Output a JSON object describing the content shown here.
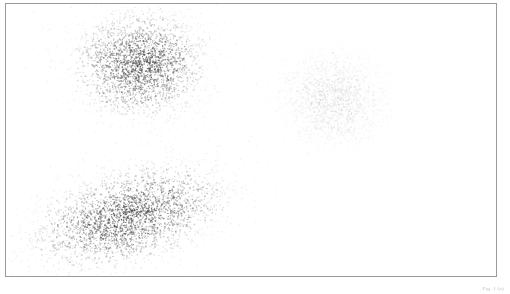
{
  "figure": {
    "title": "",
    "caption": "Fig. 1 (a)",
    "background_color": "#ffffff",
    "frame": {
      "border_color": "#9a9a9a",
      "border_width_px": 1,
      "x": 5,
      "y": 3,
      "width": 492,
      "height": 274
    }
  },
  "chart_data": {
    "type": "scatter",
    "title": "",
    "xlabel": "",
    "ylabel": "",
    "xlim": [
      0,
      510
    ],
    "ylim": [
      0,
      294
    ],
    "grid": false,
    "legend": null,
    "axis_ticks": false,
    "series": [
      {
        "name": "cluster-1-upper-left",
        "color": "#404040",
        "point_count": 2600,
        "marker_size_px": 1.1,
        "opacity": 0.85,
        "center_x": 140,
        "center_y": 64,
        "spread_x": 34,
        "spread_y": 28,
        "rotation_deg": 0,
        "shape": "round",
        "density_profile": "gaussian"
      },
      {
        "name": "cluster-2-upper-right-faint",
        "color": "#c9c9c9",
        "point_count": 2400,
        "marker_size_px": 1.1,
        "opacity": 0.5,
        "center_x": 333,
        "center_y": 98,
        "spread_x": 32,
        "spread_y": 29,
        "rotation_deg": 0,
        "shape": "round",
        "density_profile": "gaussian"
      },
      {
        "name": "cluster-3-lower-left-elongated",
        "color": "#404040",
        "point_count": 3000,
        "marker_size_px": 1.1,
        "opacity": 0.85,
        "center_x": 128,
        "center_y": 216,
        "spread_x": 52,
        "spread_y": 24,
        "rotation_deg": -16,
        "shape": "elongated",
        "density_profile": "gaussian"
      }
    ]
  }
}
